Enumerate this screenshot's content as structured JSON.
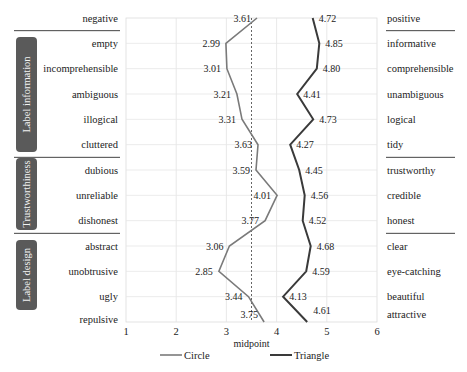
{
  "chart_data": {
    "type": "line",
    "title": "",
    "xlabel": "",
    "ylabel": "",
    "xlim": [
      1,
      6
    ],
    "x_ticks": [
      "1",
      "2",
      "3",
      "4",
      "5",
      "6"
    ],
    "midpoint": {
      "value": 3.5,
      "label": "midpoint"
    },
    "grid": true,
    "orientation": "horizontal semantic differential profile",
    "items": [
      {
        "negative": "negative",
        "positive": "positive",
        "group": ""
      },
      {
        "negative": "empty",
        "positive": "informative",
        "group": "Label information"
      },
      {
        "negative": "incomprehensible",
        "positive": "comprehensible",
        "group": "Label information"
      },
      {
        "negative": "ambiguous",
        "positive": "unambiguous",
        "group": "Label information"
      },
      {
        "negative": "illogical",
        "positive": "logical",
        "group": "Label information"
      },
      {
        "negative": "cluttered",
        "positive": "tidy",
        "group": "Label information"
      },
      {
        "negative": "dubious",
        "positive": "trustworthy",
        "group": "Trustworthiness"
      },
      {
        "negative": "unreliable",
        "positive": "credible",
        "group": "Trustworthiness"
      },
      {
        "negative": "dishonest",
        "positive": "honest",
        "group": "Trustworthiness"
      },
      {
        "negative": "abstract",
        "positive": "clear",
        "group": "Label design"
      },
      {
        "negative": "unobtrusive",
        "positive": "eye-catching",
        "group": "Label design"
      },
      {
        "negative": "ugly",
        "positive": "beautiful",
        "group": "Label design"
      },
      {
        "negative": "repulsive",
        "positive": "attractive",
        "group": "Label design"
      }
    ],
    "series": [
      {
        "name": "Circle",
        "color": "#7a7a7a",
        "values": [
          3.61,
          2.99,
          3.01,
          3.21,
          3.31,
          3.63,
          3.59,
          4.01,
          3.77,
          3.06,
          2.85,
          3.44,
          3.75
        ],
        "labels": [
          "3.61",
          "2.99",
          "3.01",
          "3.21",
          "3.31",
          "3.63",
          "3.59",
          "4.01",
          "3.77",
          "3.06",
          "2.85",
          "3.44",
          "3.75"
        ]
      },
      {
        "name": "Triangle",
        "color": "#3a3a3a",
        "values": [
          4.72,
          4.85,
          4.8,
          4.41,
          4.73,
          4.27,
          4.45,
          4.56,
          4.52,
          4.68,
          4.59,
          4.13,
          4.61
        ],
        "labels": [
          "4.72",
          "4.85",
          "4.80",
          "4.41",
          "4.73",
          "4.27",
          "4.45",
          "4.56",
          "4.52",
          "4.68",
          "4.59",
          "4.13",
          "4.61"
        ]
      }
    ],
    "groups": [
      {
        "name": "Label information",
        "color": "#5a5a5a"
      },
      {
        "name": "Trustworthiness",
        "color": "#5a5a5a"
      },
      {
        "name": "Label design",
        "color": "#5a5a5a"
      }
    ],
    "legend": {
      "position": "bottom",
      "entries": [
        "Circle",
        "Triangle"
      ]
    }
  }
}
